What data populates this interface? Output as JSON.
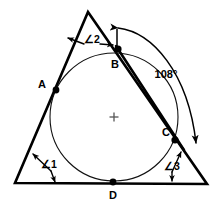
{
  "figure": {
    "background_color": "#ffffff",
    "line_color": "#000000",
    "circle_color": "#111111",
    "center_mark_color": "#555555",
    "width": 217,
    "height": 207
  },
  "vertex_labels": {
    "a": "A",
    "b": "B",
    "c": "C",
    "d": "D"
  },
  "angle_labels": {
    "angle1": "∠1",
    "angle2": "∠2",
    "angle3": "∠3"
  },
  "arc_measure": {
    "value": "108",
    "unit": "°",
    "text": "108°"
  },
  "geometry": {
    "triangle": {
      "apex": {
        "x": 88,
        "y": 12
      },
      "bottom_left": {
        "x": 15,
        "y": 183
      },
      "bottom_right": {
        "x": 207,
        "y": 184
      }
    },
    "incircle": {
      "center": {
        "x": 114,
        "y": 117
      },
      "radius": 64
    },
    "center_mark": {
      "x": 114,
      "y": 117,
      "size": 9
    },
    "tangent_points": {
      "a": {
        "x": 56,
        "y": 90
      },
      "b": {
        "x": 118,
        "y": 49
      },
      "c": {
        "x": 175,
        "y": 140
      },
      "d": {
        "x": 113,
        "y": 182
      }
    },
    "chord_bc": {
      "from": {
        "x": 118,
        "y": 49
      },
      "to": {
        "x": 180,
        "y": 145
      }
    },
    "arc_108": {
      "start": {
        "x": 117,
        "y": 28
      },
      "end": {
        "x": 196,
        "y": 147
      },
      "label_position": {
        "x": 166,
        "y": 76
      }
    }
  },
  "icon_names": {
    "point_marker": "filled-dot-icon",
    "center_marker": "cross-mark-icon",
    "arrowhead": "arrowhead-icon"
  }
}
